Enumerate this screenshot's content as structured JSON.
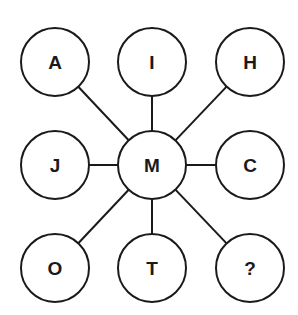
{
  "diagram": {
    "center": {
      "label": "M",
      "x": 152,
      "y": 165
    },
    "radius": 34,
    "stroke_color": "#1a1a1a",
    "nodes": [
      {
        "label": "A",
        "x": 55,
        "y": 62
      },
      {
        "label": "I",
        "x": 152,
        "y": 62
      },
      {
        "label": "H",
        "x": 250,
        "y": 62
      },
      {
        "label": "J",
        "x": 55,
        "y": 165
      },
      {
        "label": "C",
        "x": 250,
        "y": 165
      },
      {
        "label": "O",
        "x": 55,
        "y": 268
      },
      {
        "label": "T",
        "x": 152,
        "y": 268
      },
      {
        "label": "?",
        "x": 250,
        "y": 268
      }
    ]
  }
}
